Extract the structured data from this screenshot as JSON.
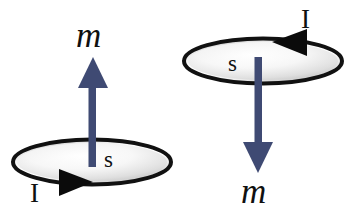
{
  "figure": {
    "background_color": "#ffffff",
    "width": 349,
    "height": 222,
    "colors": {
      "arrow_vector": "#3f4a73",
      "outline": "#111111",
      "loop_fill_light": "#fdfdfd",
      "loop_fill_shade": "#c9c9c9",
      "text": "#101010"
    },
    "diagrams": [
      {
        "id": "left-diagram",
        "name": "current-loop-moment-up",
        "loop": {
          "cx": 92,
          "cy": 162,
          "rx": 80,
          "ry": 23,
          "current_direction": "counterclockwise-viewed-from-above",
          "current_marker": "right-pointing-triangle"
        },
        "vector": {
          "label": "m",
          "direction": "up",
          "x": 93,
          "tail_y": 166,
          "head_y": 58
        },
        "labels": {
          "moment": "m",
          "spin": "s",
          "current": "I"
        }
      },
      {
        "id": "right-diagram",
        "name": "current-loop-moment-down",
        "loop": {
          "cx": 263,
          "cy": 61,
          "rx": 80,
          "ry": 23,
          "current_direction": "clockwise-viewed-from-above",
          "current_marker": "left-pointing-triangle"
        },
        "vector": {
          "label": "m",
          "direction": "down",
          "x": 258,
          "tail_y": 60,
          "head_y": 172
        },
        "labels": {
          "moment": "m",
          "spin": "s",
          "current": "I"
        }
      }
    ]
  }
}
